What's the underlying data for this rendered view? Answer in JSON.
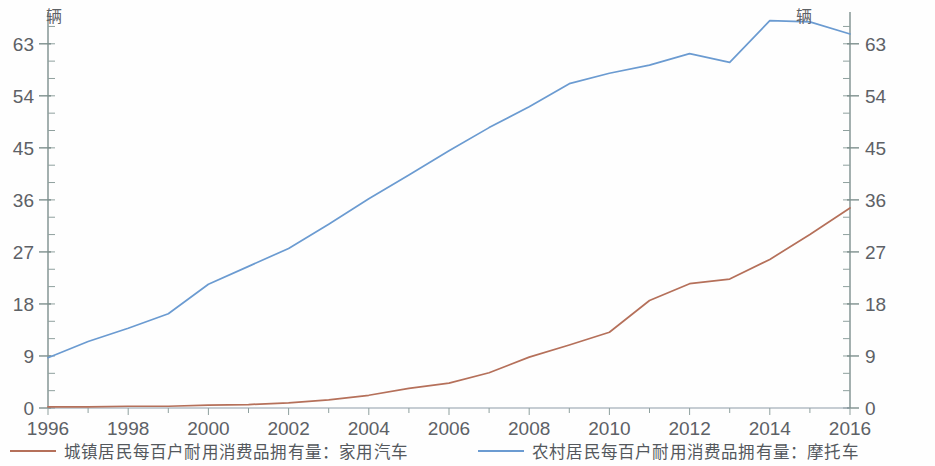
{
  "chart_data": {
    "type": "line",
    "title": "",
    "subtitle": "",
    "xlabel": "",
    "ylabel": "",
    "left_axis": {
      "unit": "辆",
      "ticks": [
        "0",
        "9",
        "18",
        "27",
        "36",
        "45",
        "54",
        "63"
      ],
      "min": 0,
      "max": 68.5,
      "minor_ticks_per_interval": 2
    },
    "right_axis": {
      "unit": "辆",
      "ticks": [
        "0",
        "9",
        "18",
        "27",
        "36",
        "45",
        "54",
        "63"
      ],
      "min": 0,
      "max": 68.5,
      "minor_ticks_per_interval": 2
    },
    "x": [
      1996,
      1997,
      1998,
      1999,
      2000,
      2001,
      2002,
      2003,
      2004,
      2005,
      2006,
      2007,
      2008,
      2009,
      2010,
      2011,
      2012,
      2013,
      2014,
      2015,
      2016
    ],
    "xtick_labels": [
      "1996",
      "1998",
      "2000",
      "2002",
      "2004",
      "2006",
      "2008",
      "2010",
      "2012",
      "2014",
      "2016"
    ],
    "xlim": [
      1996,
      2016
    ],
    "grid": false,
    "legend_position": "bottom",
    "series": [
      {
        "name": "城镇居民每百户耐用消费品拥有量：家用汽车",
        "color": "#b5705a",
        "axis": "left",
        "values": [
          0.2,
          0.2,
          0.3,
          0.3,
          0.5,
          0.6,
          0.9,
          1.4,
          2.2,
          3.4,
          4.3,
          6.1,
          8.8,
          10.9,
          13.1,
          18.6,
          21.5,
          22.3,
          25.7,
          30.0,
          34.6
        ]
      },
      {
        "name": "农村居民每百户耐用消费品拥有量：摩托车",
        "color": "#6b9bd1",
        "axis": "right",
        "values": [
          8.7,
          11.5,
          13.8,
          16.3,
          21.4,
          24.5,
          27.6,
          31.8,
          36.2,
          40.3,
          44.5,
          48.5,
          52.1,
          56.1,
          57.9,
          59.3,
          61.3,
          59.8,
          67.0,
          66.8,
          64.7
        ]
      }
    ]
  },
  "legend": {
    "entries": [
      {
        "label": "城镇居民每百户耐用消费品拥有量：家用汽车",
        "color": "#b5705a"
      },
      {
        "label": "农村居民每百户耐用消费品拥有量：摩托车",
        "color": "#6b9bd1"
      }
    ]
  },
  "axis_units": {
    "left": "辆",
    "right": "辆"
  }
}
